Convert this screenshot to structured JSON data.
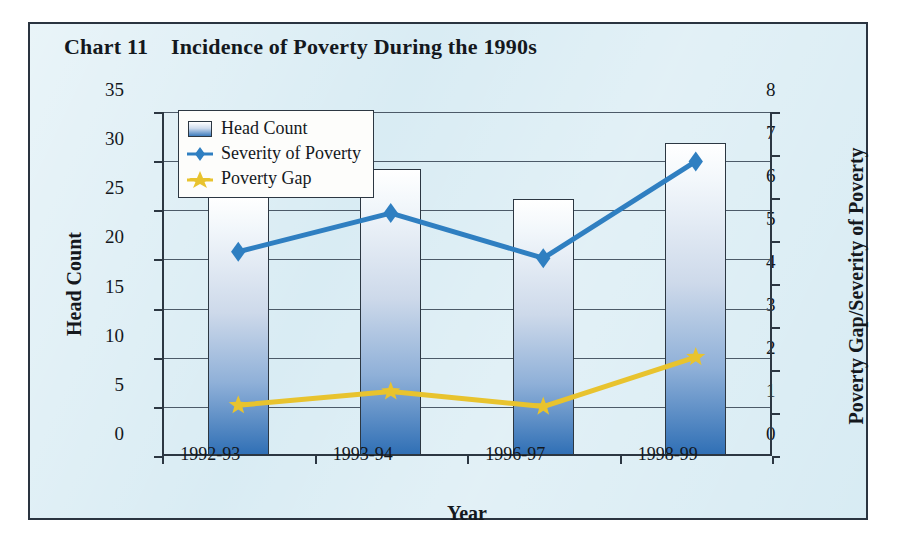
{
  "figure": {
    "title": "Chart 11    Incidence of Poverty During the 1990s"
  },
  "legend": {
    "items": [
      {
        "label": "Head Count",
        "marker": "bar-swatch-icon",
        "color": "#3d7cbd"
      },
      {
        "label": "Severity of Poverty",
        "marker": "diamond-marker-icon",
        "color": "#2f7fc1"
      },
      {
        "label": "Poverty Gap",
        "marker": "star-marker-icon",
        "color": "#e8c32e"
      }
    ]
  },
  "axes": {
    "x_title": "Year",
    "y_left_title": "Head Count",
    "y_right_title": "Poverty Gap/Severity of Poverty",
    "y_left_ticks": [
      "35",
      "30",
      "25",
      "20",
      "15",
      "10",
      "5",
      "0"
    ],
    "y_right_ticks": [
      "8",
      "7",
      "6",
      "5",
      "4",
      "3",
      "2",
      "1",
      "0"
    ],
    "x_ticks": [
      "1992-93",
      "1993-94",
      "1996-97",
      "1998-99"
    ]
  },
  "chart_data": {
    "type": "bar",
    "title": "Chart 11    Incidence of Poverty During the 1990s",
    "xlabel": "Year",
    "ylabel": "Head Count",
    "y2label": "Poverty Gap/Severity of Poverty",
    "categories": [
      "1992-93",
      "1993-94",
      "1996-97",
      "1998-99"
    ],
    "ylim": [
      0,
      35
    ],
    "y2lim": [
      0,
      8
    ],
    "y_ticks": [
      0,
      5,
      10,
      15,
      20,
      25,
      30,
      35
    ],
    "y2_ticks": [
      0,
      1,
      2,
      3,
      4,
      5,
      6,
      7,
      8
    ],
    "grid": true,
    "legend_position": "top-left inside plot",
    "series": [
      {
        "name": "Head Count",
        "type": "bar",
        "axis": "left",
        "color": "#3d7cbd",
        "values": [
          26.5,
          29.2,
          26.1,
          31.8
        ]
      },
      {
        "name": "Severity of Poverty",
        "type": "line",
        "axis": "right",
        "color": "#2f7fc1",
        "marker": "diamond",
        "values": [
          4.75,
          5.65,
          4.6,
          6.85
        ]
      },
      {
        "name": "Poverty Gap",
        "type": "line",
        "axis": "right",
        "color": "#e8c32e",
        "marker": "star",
        "values": [
          1.18,
          1.5,
          1.15,
          2.3
        ]
      }
    ]
  },
  "colors": {
    "panel_background": "#d7ebf3",
    "frame": "#2a3440",
    "grid": "#4c5a68",
    "bar_top": "#ffffff",
    "bar_bottom": "#2f6fb5",
    "severity_line": "#2f7fc1",
    "gap_line": "#e8c32e"
  }
}
